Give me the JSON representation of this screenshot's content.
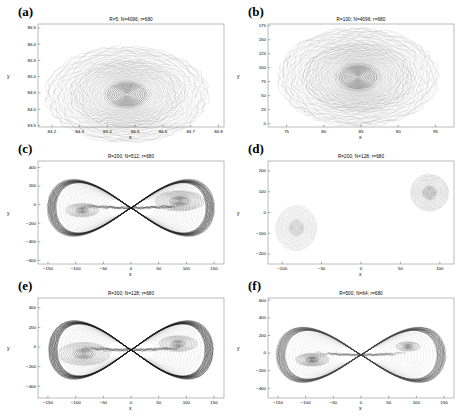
{
  "figure": {
    "panel_count": 6,
    "xlabel": "x",
    "ylabel": "y"
  },
  "chart_data": [
    {
      "type": "line",
      "panel": "(a)",
      "title": "R=5; N=4096; r=680",
      "xlabel": "x",
      "ylabel": "y",
      "xlim": [
        84.15,
        84.82
      ],
      "ylim": [
        83.45,
        86.62
      ],
      "xticks": [
        84.2,
        84.3,
        84.4,
        84.5,
        84.6,
        84.7,
        84.8
      ],
      "yticks": [
        83.5,
        84.0,
        84.5,
        85.0,
        85.5,
        86.0,
        86.5
      ],
      "xticklabels": [
        "84.2",
        "84.3",
        "84.4",
        "84.5",
        "84.6",
        "84.7",
        "84.8"
      ],
      "yticklabels": [
        "83.5",
        "84.0",
        "84.5",
        "85.0",
        "85.5",
        "86.0",
        "86.5"
      ],
      "grid": false,
      "legend": null,
      "structure": "single-well spiral",
      "orbit_centers": [
        [
          84.47,
          84.45
        ]
      ],
      "orbit_max_rx": 0.295,
      "orbit_max_ry": 1.48,
      "orbit_rings": 46,
      "line_color": "#3a3a3a"
    },
    {
      "type": "line",
      "panel": "(b)",
      "title": "R=100; N=4096; r=680",
      "xlabel": "x",
      "ylabel": "y",
      "xlim": [
        72.5,
        97.5
      ],
      "ylim": [
        -6,
        178
      ],
      "xticks": [
        75,
        80,
        85,
        90,
        95
      ],
      "yticks": [
        0,
        25,
        50,
        75,
        100,
        125,
        150,
        175
      ],
      "xticklabels": [
        "75",
        "80",
        "85",
        "90",
        "95"
      ],
      "yticklabels": [
        "0",
        "25",
        "50",
        "75",
        "100",
        "125",
        "150",
        "175"
      ],
      "grid": false,
      "legend": null,
      "structure": "single-well spiral",
      "orbit_centers": [
        [
          84.6,
          83.0
        ]
      ],
      "orbit_max_rx": 10.8,
      "orbit_max_ry": 88.0,
      "orbit_rings": 52,
      "line_color": "#3a3a3a"
    },
    {
      "type": "line",
      "panel": "(c)",
      "title": "R=200; N=512; r=680",
      "xlabel": "x",
      "ylabel": "y",
      "xlim": [
        -168,
        168
      ],
      "ylim": [
        -640,
        470
      ],
      "xticks": [
        -150,
        -100,
        -50,
        0,
        50,
        100,
        150
      ],
      "yticks": [
        -600,
        -400,
        -200,
        0,
        200,
        400
      ],
      "xticklabels": [
        "−150",
        "−100",
        "−50",
        "0",
        "50",
        "100",
        "150"
      ],
      "yticklabels": [
        "−600",
        "−400",
        "−200",
        "0",
        "200",
        "400"
      ],
      "grid": false,
      "legend": null,
      "structure": "double-well figure-eight with separatrix",
      "well_centers": [
        [
          -88,
          -60
        ],
        [
          88,
          40
        ]
      ],
      "saddle": [
        0,
        -35
      ],
      "lobe_half_width": 150,
      "lobe_half_height": 420,
      "core_radii": [
        [
          30,
          72
        ],
        [
          44,
          108
        ]
      ],
      "core_rings": [
        12,
        16
      ],
      "line_color": "#232323"
    },
    {
      "type": "line",
      "panel": "(d)",
      "title": "R=200; N=128; r=680",
      "xlabel": "x",
      "ylabel": "y",
      "xlim": [
        -118,
        118
      ],
      "ylim": [
        -248,
        248
      ],
      "xticks": [
        -100,
        -50,
        0,
        50,
        100
      ],
      "yticks": [
        -200,
        -100,
        0,
        100,
        200
      ],
      "xticklabels": [
        "−100",
        "−50",
        "0",
        "50",
        "100"
      ],
      "yticklabels": [
        "−200",
        "−100",
        "0",
        "100",
        "200"
      ],
      "grid": false,
      "legend": null,
      "structure": "two isolated wells, no separatrix crossing",
      "well_centers": [
        [
          -82,
          -75
        ],
        [
          87,
          95
        ]
      ],
      "core_radii": [
        [
          26,
          108
        ],
        [
          24,
          88
        ]
      ],
      "core_rings": [
        16,
        16
      ],
      "line_color": "#555555"
    },
    {
      "type": "line",
      "panel": "(e)",
      "title": "R=300; N=128; r=680",
      "xlabel": "x",
      "ylabel": "y",
      "xlim": [
        -168,
        168
      ],
      "ylim": [
        -520,
        500
      ],
      "xticks": [
        -150,
        -100,
        -50,
        0,
        50,
        100,
        150
      ],
      "yticks": [
        -400,
        -200,
        0,
        200,
        400
      ],
      "xticklabels": [
        "−150",
        "−100",
        "−50",
        "0",
        "50",
        "100",
        "150"
      ],
      "yticklabels": [
        "−400",
        "−200",
        "0",
        "200",
        "400"
      ],
      "grid": false,
      "legend": null,
      "structure": "double-well figure-eight with separatrix",
      "well_centers": [
        [
          -85,
          -70
        ],
        [
          85,
          35
        ]
      ],
      "saddle": [
        0,
        -30
      ],
      "lobe_half_width": 148,
      "lobe_half_height": 410,
      "core_radii": [
        [
          48,
          115
        ],
        [
          34,
          80
        ]
      ],
      "core_rings": [
        14,
        12
      ],
      "line_color": "#1d1d1d"
    },
    {
      "type": "line",
      "panel": "(f)",
      "title": "R=500; N=64; r=680",
      "xlabel": "x",
      "ylabel": "y",
      "xlim": [
        -168,
        168
      ],
      "ylim": [
        -510,
        625
      ],
      "xticks": [
        -150,
        -100,
        -50,
        0,
        50,
        100,
        150
      ],
      "yticks": [
        -400,
        -200,
        0,
        200,
        400,
        600
      ],
      "xticklabels": [
        "−150",
        "−100",
        "−50",
        "0",
        "50",
        "100",
        "150"
      ],
      "yticklabels": [
        "−400",
        "−200",
        "0",
        "200",
        "400",
        "600"
      ],
      "grid": false,
      "legend": null,
      "structure": "double-well figure-eight with separatrix",
      "well_centers": [
        [
          -88,
          -75
        ],
        [
          85,
          75
        ]
      ],
      "saddle": [
        0,
        -20
      ],
      "lobe_half_width": 152,
      "lobe_half_height": 430,
      "core_radii": [
        [
          30,
          72
        ],
        [
          22,
          52
        ]
      ],
      "core_rings": [
        14,
        9
      ],
      "line_color": "#444444"
    }
  ]
}
